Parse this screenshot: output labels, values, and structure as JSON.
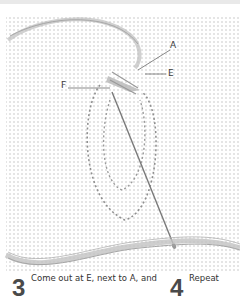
{
  "illustration": {
    "subject": "embroidery-stitch-diagram",
    "labels": [
      {
        "id": "A",
        "text": "A"
      },
      {
        "id": "E",
        "text": "E"
      },
      {
        "id": "F",
        "text": "F"
      }
    ],
    "colors": {
      "fabric_dots": "#d6d6d6",
      "thread": "#9a9a9a",
      "needle": "#8a8a8a",
      "leader_line": "#555555"
    }
  },
  "steps": [
    {
      "number": "3",
      "text": "Come out at E, next to A, and"
    },
    {
      "number": "4",
      "text": "Repeat"
    }
  ]
}
